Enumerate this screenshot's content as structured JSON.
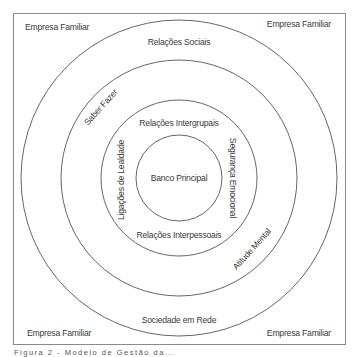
{
  "diagram": {
    "corners": {
      "top_left": "Empresa Familiar",
      "top_right": "Empresa Familiar",
      "bottom_left": "Empresa Familiar",
      "bottom_right": "Empresa Familiar"
    },
    "outer_ring": {
      "top": "Relações Sociais",
      "bottom": "Sociedade em Rede"
    },
    "middle_ring": {
      "upper_left": "Saber Fazer",
      "lower_right": "Atitude Mental"
    },
    "inner_ring": {
      "top": "Relações Intergrupais",
      "bottom": "Relações Interpessoais",
      "left": "Ligações de Lealdade",
      "right": "Segurança Emocional"
    },
    "center": "Banco Principal",
    "colors": {
      "line": "#555555",
      "frame": "#888888",
      "text": "#3a3a3a"
    }
  },
  "caption": "Figura 2 - Modelo de Gestão da..."
}
